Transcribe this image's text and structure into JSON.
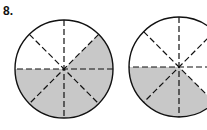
{
  "problem": {
    "number": "8.",
    "circles": [
      {
        "cx": 64,
        "cy": 69,
        "r": 49,
        "sectors": 8,
        "shaded_sectors": [
          0,
          4,
          5,
          6,
          7
        ],
        "shaded_fraction": "5/8"
      },
      {
        "cx": 179,
        "cy": 67,
        "r": 50,
        "sectors": 8,
        "shaded_sectors": [
          4,
          5,
          6
        ],
        "shaded_fraction": "3/8"
      }
    ],
    "colors": {
      "shade": "#c8c8c8",
      "stroke": "#111111",
      "background": "#ffffff"
    }
  }
}
